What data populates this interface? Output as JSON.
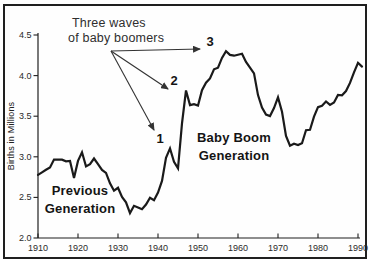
{
  "figure": {
    "background": "#ffffff",
    "frame_color": "#1f1f1f",
    "labels": {
      "annotation_title": [
        "Three waves",
        "of baby boomers"
      ],
      "previous_generation": [
        "Previous",
        "Generation"
      ],
      "baby_boom_generation": [
        "Baby Boom",
        "Generation"
      ]
    }
  },
  "chart_data": {
    "type": "line",
    "title": "",
    "xlabel": "",
    "ylabel": "Births in Millions",
    "grid": false,
    "legend": "none",
    "line_color": "#1a1a1a",
    "axis_color": "#1f1f1f",
    "tick_label_color": "#2a2a2a",
    "xlim": [
      1910,
      1991
    ],
    "ylim": [
      2.0,
      4.5
    ],
    "x_ticks": [
      1910,
      1920,
      1930,
      1940,
      1950,
      1960,
      1970,
      1980,
      1990
    ],
    "y_ticks": [
      "2.0",
      "2.5",
      "3.0",
      "3.5",
      "4.0",
      "4.5"
    ],
    "x": [
      1910,
      1911,
      1912,
      1913,
      1914,
      1915,
      1916,
      1917,
      1918,
      1919,
      1920,
      1921,
      1922,
      1923,
      1924,
      1925,
      1926,
      1927,
      1928,
      1929,
      1930,
      1931,
      1932,
      1933,
      1934,
      1935,
      1936,
      1937,
      1938,
      1939,
      1940,
      1941,
      1942,
      1943,
      1944,
      1945,
      1946,
      1947,
      1948,
      1949,
      1950,
      1951,
      1952,
      1953,
      1954,
      1955,
      1956,
      1957,
      1958,
      1959,
      1960,
      1961,
      1962,
      1963,
      1964,
      1965,
      1966,
      1967,
      1968,
      1969,
      1970,
      1971,
      1972,
      1973,
      1974,
      1975,
      1976,
      1977,
      1978,
      1979,
      1980,
      1981,
      1982,
      1983,
      1984,
      1985,
      1986,
      1987,
      1988,
      1989,
      1990,
      1991
    ],
    "values": [
      2.777,
      2.809,
      2.84,
      2.869,
      2.966,
      2.965,
      2.964,
      2.944,
      2.948,
      2.74,
      2.95,
      3.055,
      2.882,
      2.91,
      2.979,
      2.909,
      2.839,
      2.802,
      2.674,
      2.582,
      2.618,
      2.506,
      2.44,
      2.307,
      2.396,
      2.377,
      2.355,
      2.413,
      2.496,
      2.466,
      2.559,
      2.703,
      2.989,
      3.104,
      2.939,
      2.858,
      3.411,
      3.817,
      3.637,
      3.649,
      3.632,
      3.82,
      3.913,
      3.965,
      4.078,
      4.097,
      4.218,
      4.3,
      4.255,
      4.245,
      4.258,
      4.268,
      4.167,
      4.098,
      4.027,
      3.76,
      3.606,
      3.521,
      3.502,
      3.6,
      3.731,
      3.556,
      3.258,
      3.137,
      3.16,
      3.144,
      3.168,
      3.327,
      3.333,
      3.494,
      3.612,
      3.629,
      3.681,
      3.639,
      3.669,
      3.761,
      3.757,
      3.809,
      3.91,
      4.041,
      4.158,
      4.111
    ],
    "annotations": [
      {
        "label": "1"
      },
      {
        "label": "2"
      },
      {
        "label": "3"
      }
    ]
  }
}
